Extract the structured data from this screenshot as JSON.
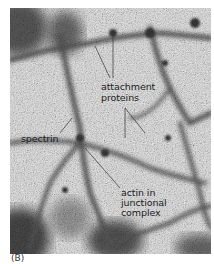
{
  "figure": {
    "panel_label": "(B)",
    "labels": {
      "attachment_line1": "attachment",
      "attachment_line2": "proteins",
      "spectrin": "spectrin",
      "actin_line1": "actin in",
      "actin_line2": "junctional",
      "actin_line3": "complex"
    },
    "colors": {
      "background_gray": "#bdbdbd",
      "strand_dark": "#3a3a3a",
      "label_text": "#222222"
    }
  }
}
